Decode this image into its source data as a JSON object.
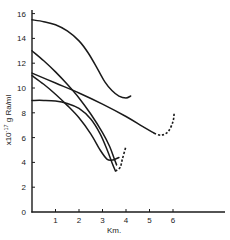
{
  "chart_data": {
    "type": "line",
    "title": "",
    "xlabel": "Km.",
    "ylabel": "x10^-17 g Ra/ml",
    "ylabel_display": "x10",
    "ylabel_exp": "-17",
    "ylabel_rest": " g Ra/ml",
    "xlim": [
      0,
      6.5
    ],
    "ylim": [
      0,
      16.5
    ],
    "x_ticks": [
      1,
      2,
      3,
      4,
      5,
      6
    ],
    "x_tick_labels": [
      "1",
      "2",
      "3",
      "4",
      "5",
      "6"
    ],
    "y_ticks": [
      0,
      2,
      4,
      6,
      8,
      10,
      12,
      14,
      16
    ],
    "y_tick_labels": [
      "0",
      "2",
      "4",
      "6",
      "8",
      "10",
      "12",
      "14",
      "16"
    ],
    "grid": false,
    "legend": null,
    "line_color": "#1a1a1a",
    "series": [
      {
        "name": "curve-1",
        "style": "solid",
        "points": [
          [
            0,
            15.5
          ],
          [
            0.5,
            15.35
          ],
          [
            1,
            15.1
          ],
          [
            1.5,
            14.6
          ],
          [
            2,
            13.8
          ],
          [
            2.4,
            12.8
          ],
          [
            2.8,
            11.5
          ],
          [
            3.1,
            10.5
          ],
          [
            3.4,
            9.8
          ],
          [
            3.7,
            9.35
          ],
          [
            4.0,
            9.2
          ],
          [
            4.2,
            9.35
          ]
        ]
      },
      {
        "name": "curve-2",
        "style": "solid",
        "points": [
          [
            0,
            13.0
          ],
          [
            0.5,
            12.2
          ],
          [
            1,
            11.3
          ],
          [
            1.5,
            10.3
          ],
          [
            2,
            9.2
          ],
          [
            2.5,
            7.9
          ],
          [
            3,
            6.4
          ],
          [
            3.3,
            5.3
          ],
          [
            3.5,
            4.3
          ],
          [
            3.6,
            3.8
          ]
        ]
      },
      {
        "name": "curve-3",
        "style": "solid",
        "points": [
          [
            0,
            11.2
          ],
          [
            1,
            10.4
          ],
          [
            2,
            9.6
          ],
          [
            3,
            8.7
          ],
          [
            4,
            7.7
          ],
          [
            4.7,
            6.9
          ],
          [
            5.2,
            6.35
          ]
        ],
        "dashed_extension": [
          [
            5.2,
            6.35
          ],
          [
            5.5,
            6.2
          ],
          [
            5.8,
            6.5
          ],
          [
            6.0,
            7.3
          ],
          [
            6.05,
            8.0
          ]
        ]
      },
      {
        "name": "curve-4",
        "style": "solid",
        "points": [
          [
            0,
            11.0
          ],
          [
            0.5,
            10.3
          ],
          [
            1,
            9.5
          ],
          [
            1.5,
            8.6
          ],
          [
            2,
            7.6
          ],
          [
            2.5,
            6.3
          ],
          [
            2.9,
            5.0
          ],
          [
            3.2,
            4.25
          ],
          [
            3.45,
            4.2
          ],
          [
            3.7,
            4.4
          ]
        ]
      },
      {
        "name": "curve-5",
        "style": "solid",
        "points": [
          [
            0,
            9.0
          ],
          [
            0.5,
            9.0
          ],
          [
            1,
            8.95
          ],
          [
            1.5,
            8.75
          ],
          [
            2,
            8.35
          ],
          [
            2.5,
            7.5
          ],
          [
            2.9,
            6.3
          ],
          [
            3.2,
            5.0
          ],
          [
            3.4,
            4.0
          ],
          [
            3.55,
            3.3
          ]
        ],
        "dashed_extension": [
          [
            3.55,
            3.3
          ],
          [
            3.75,
            3.6
          ],
          [
            3.85,
            4.3
          ],
          [
            4.0,
            5.3
          ]
        ]
      }
    ]
  }
}
